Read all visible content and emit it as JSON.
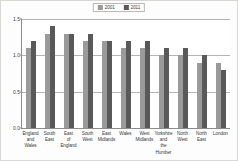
{
  "chart_data": {
    "type": "bar",
    "title": "",
    "subtitle": "",
    "xlabel": "",
    "ylabel": "",
    "ylim": [
      0.0,
      1.5
    ],
    "yticks": [
      "0.0",
      "0.5",
      "1.0",
      "1.5"
    ],
    "ytick_values": [
      0.0,
      0.5,
      1.0,
      1.5
    ],
    "grid": true,
    "legend_position": "top-center",
    "categories": [
      "England and Wales",
      "South East",
      "East of England",
      "South West",
      "East Midlands",
      "Wales",
      "West Midlands",
      "Yorkshire and the Humber",
      "North West",
      "North East",
      "London"
    ],
    "series": [
      {
        "name": "2001",
        "color": "#9a9a9a",
        "values": [
          1.1,
          1.3,
          1.3,
          1.2,
          1.2,
          1.1,
          1.1,
          1.0,
          1.0,
          0.9,
          0.9
        ]
      },
      {
        "name": "2011",
        "color": "#595959",
        "values": [
          1.2,
          1.4,
          1.3,
          1.3,
          1.2,
          1.2,
          1.2,
          1.1,
          1.1,
          1.0,
          0.8
        ]
      }
    ]
  },
  "legend": {
    "entries": [
      {
        "label": "2001",
        "color": "#9a9a9a"
      },
      {
        "label": "2011",
        "color": "#595959"
      }
    ]
  }
}
